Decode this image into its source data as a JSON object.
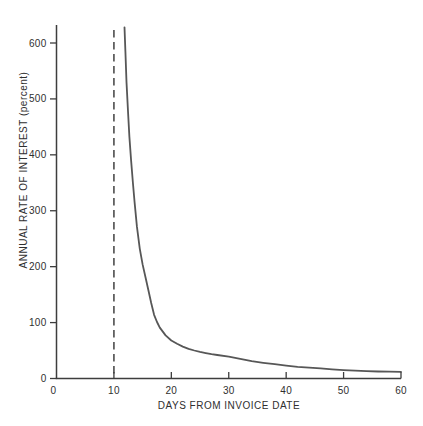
{
  "figure": {
    "background_color": "#ffffff",
    "width_px": 423,
    "height_px": 426
  },
  "chart_data": {
    "type": "line",
    "title": "",
    "xlabel": "DAYS FROM INVOICE DATE",
    "ylabel": "ANNUAL RATE OF INTEREST (percent)",
    "xlim": [
      0,
      60
    ],
    "ylim": [
      0,
      632
    ],
    "x_ticks": [
      0,
      10,
      20,
      30,
      40,
      50,
      60
    ],
    "y_ticks": [
      0,
      100,
      200,
      300,
      400,
      500,
      600
    ],
    "grid": false,
    "legend": "none",
    "axis_color": "#3d3d3d",
    "text_color": "#2f2f2f",
    "series": [
      {
        "name": "annualized-interest-cost-curve",
        "color": "#575757",
        "points": [
          [
            11.85,
            628
          ],
          [
            12.0,
            585
          ],
          [
            12.2,
            530
          ],
          [
            12.45,
            478
          ],
          [
            12.7,
            432
          ],
          [
            13.0,
            390
          ],
          [
            13.3,
            350
          ],
          [
            13.6,
            315
          ],
          [
            14.0,
            272
          ],
          [
            14.5,
            232
          ],
          [
            15.0,
            204
          ],
          [
            15.5,
            181
          ],
          [
            16.0,
            158
          ],
          [
            16.5,
            135
          ],
          [
            17.0,
            114
          ],
          [
            17.5,
            101
          ],
          [
            18.0,
            91
          ],
          [
            19.0,
            77
          ],
          [
            20.0,
            68
          ],
          [
            21,
            62
          ],
          [
            22,
            57
          ],
          [
            23,
            53
          ],
          [
            24,
            50
          ],
          [
            25,
            47.5
          ],
          [
            26,
            45.5
          ],
          [
            27,
            43.5
          ],
          [
            28,
            42
          ],
          [
            30,
            39
          ],
          [
            32,
            35
          ],
          [
            34,
            31
          ],
          [
            36,
            28
          ],
          [
            38,
            25.5
          ],
          [
            40,
            23
          ],
          [
            42,
            21
          ],
          [
            44,
            19.5
          ],
          [
            46,
            18
          ],
          [
            48,
            16.5
          ],
          [
            50,
            15
          ],
          [
            52,
            14
          ],
          [
            54,
            13.2
          ],
          [
            56,
            12.6
          ],
          [
            58,
            12.2
          ],
          [
            60,
            12
          ]
        ]
      }
    ],
    "reference_lines": [
      {
        "name": "end-of-discount-period",
        "axis": "x",
        "value": 10,
        "style": "dashed",
        "color": "#4d4d4d"
      }
    ]
  }
}
